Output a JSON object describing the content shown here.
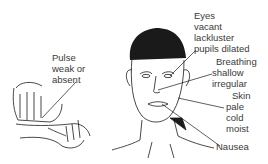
{
  "diagram": {
    "labels": {
      "pulse": [
        "Pulse",
        "weak or",
        "absent"
      ],
      "eyes": [
        "Eyes",
        "vacant",
        "lackluster",
        "pupils dilated"
      ],
      "breathing": [
        "Breathing",
        "shallow",
        "irregular"
      ],
      "skin": [
        "Skin",
        "pale",
        "cold",
        "moist"
      ],
      "nausea": [
        "Nausea"
      ]
    },
    "colors": {
      "line": "#1a1a1a",
      "text": "#3a3a3a",
      "background": "#ffffff"
    }
  }
}
